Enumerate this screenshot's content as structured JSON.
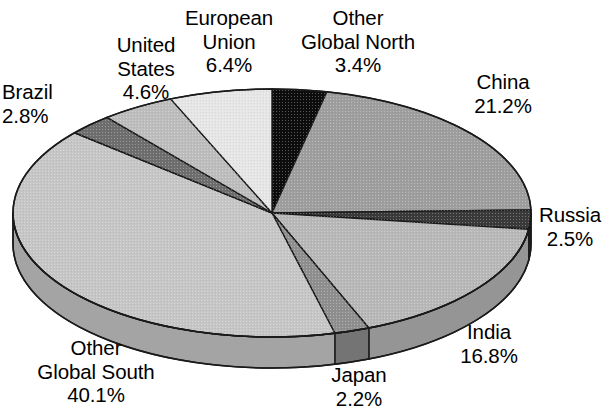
{
  "title": {
    "text_fragment": "",
    "note": "title is cropped off the top edge of the screenshot; only a small ink remnant is visible"
  },
  "chart_data": {
    "type": "pie",
    "title": "",
    "subtitle": "",
    "xlabel": "",
    "ylabel": "",
    "style": "3d-exploded-none",
    "legend_position": "labels-around-pie",
    "grid": false,
    "units": "percent",
    "total": 100.0,
    "start_angle_deg": 0,
    "direction": "clockwise",
    "categories": [
      "Other Global North",
      "China",
      "Russia",
      "India",
      "Japan",
      "Other Global South",
      "Brazil",
      "United States",
      "European Union"
    ],
    "values": [
      3.4,
      21.2,
      2.5,
      16.8,
      2.2,
      40.1,
      2.8,
      4.6,
      6.4
    ],
    "slices": [
      {
        "name": "Other Global North",
        "label_line1": "Other",
        "label_line2": "Global North",
        "value": 3.4,
        "value_label": "3.4%",
        "color": "#0d0d0d",
        "side_color": "#000000"
      },
      {
        "name": "China",
        "label_line1": "China",
        "label_line2": "",
        "value": 21.2,
        "value_label": "21.2%",
        "color": "#9e9e9e",
        "side_color": "#7d7d7d"
      },
      {
        "name": "Russia",
        "label_line1": "Russia",
        "label_line2": "",
        "value": 2.5,
        "value_label": "2.5%",
        "color": "#3a3a3a",
        "side_color": "#2b2b2b"
      },
      {
        "name": "India",
        "label_line1": "India",
        "label_line2": "",
        "value": 16.8,
        "value_label": "16.8%",
        "color": "#b8b8b8",
        "side_color": "#959595"
      },
      {
        "name": "Japan",
        "label_line1": "Japan",
        "label_line2": "",
        "value": 2.2,
        "value_label": "2.2%",
        "color": "#8f8f8f",
        "side_color": "#747474"
      },
      {
        "name": "Other Global South",
        "label_line1": "Other",
        "label_line2": "Global South",
        "value": 40.1,
        "value_label": "40.1%",
        "color": "#c6c6c6",
        "side_color": "#a4a4a4"
      },
      {
        "name": "Brazil",
        "label_line1": "Brazil",
        "label_line2": "",
        "value": 2.8,
        "value_label": "2.8%",
        "color": "#6e6e6e",
        "side_color": "#5a5a5a"
      },
      {
        "name": "United States",
        "label_line1": "United",
        "label_line2": "States",
        "value": 4.6,
        "value_label": "4.6%",
        "color": "#bdbdbd",
        "side_color": "#9a9a9a"
      },
      {
        "name": "European Union",
        "label_line1": "European",
        "label_line2": "Union",
        "value": 6.4,
        "value_label": "6.4%",
        "color": "#e6e6e6",
        "side_color": "#c2c2c2"
      }
    ]
  },
  "labels": {
    "brazil": {
      "l1": "Brazil",
      "l2": "2.8%"
    },
    "united_states": {
      "l1": "United",
      "l2": "States",
      "l3": "4.6%"
    },
    "european_union": {
      "l1": "European",
      "l2": "Union",
      "l3": "6.4%"
    },
    "other_north": {
      "l1": "Other",
      "l2": "Global North",
      "l3": "3.4%"
    },
    "china": {
      "l1": "China",
      "l2": "21.2%"
    },
    "russia": {
      "l1": "Russia",
      "l2": "2.5%"
    },
    "india": {
      "l1": "India",
      "l2": "16.8%"
    },
    "japan": {
      "l1": "Japan",
      "l2": "2.2%"
    },
    "other_south": {
      "l1": "Other",
      "l2": "Global South",
      "l3": "40.1%"
    }
  },
  "colors": {
    "background": "#ffffff",
    "text": "#000000",
    "outline": "#1a1a1a"
  },
  "geometry": {
    "cx": 272,
    "cy": 213,
    "rx": 259,
    "ry": 124,
    "depth": 31
  }
}
